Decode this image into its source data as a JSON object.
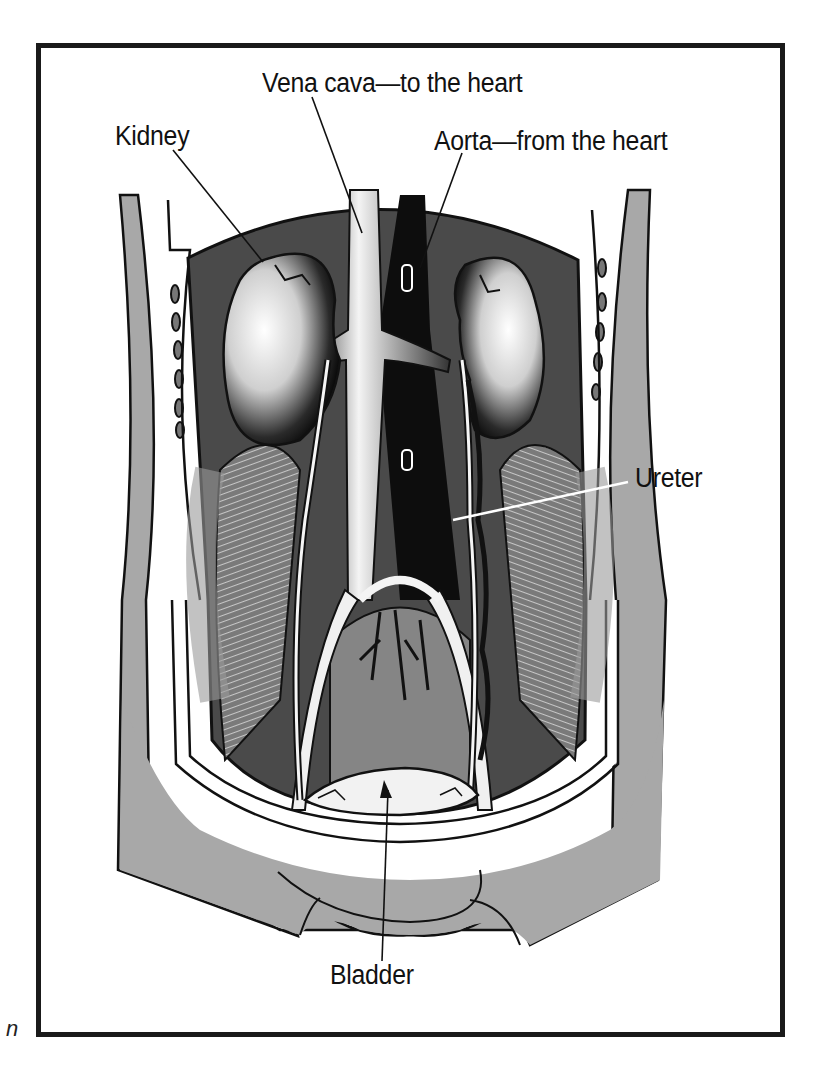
{
  "figure": {
    "type": "anatomical illustration",
    "frame_color": "#1a1a1a",
    "colors": {
      "skin_gray": "#a8a8a8",
      "cavity_dark": "#4a4a4a",
      "muscle_gray": "#8c8c8c",
      "vessel_black": "#0d0d0d",
      "highlight_white": "#ffffff"
    }
  },
  "labels": {
    "vena_cava": "Vena cava—to the heart",
    "kidney": "Kidney",
    "aorta": "Aorta—from the heart",
    "ureter": "Ureter",
    "bladder": "Bladder"
  },
  "stray_mark": "n"
}
